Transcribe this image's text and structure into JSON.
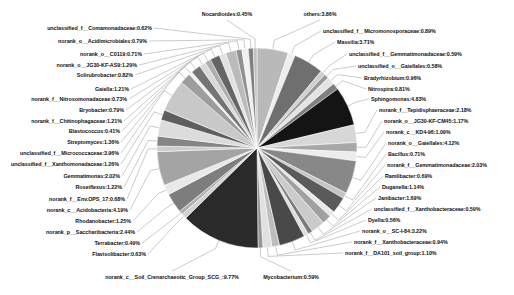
{
  "chart_data": {
    "type": "pie",
    "title": "",
    "subtitle": "",
    "xlabel": "",
    "ylabel": "",
    "legend_position": "labels-with-leader-lines",
    "grid": false,
    "value_unit": "percent",
    "label_format": "{name}:{value}%",
    "categories": [
      "others",
      "unclassified_f__Micromonosporaceae",
      "Massilia",
      "unclassified_f__Gemmatimonadaceae",
      "unclassified_o__Gaiellales",
      "Bradyrhizobium",
      "Nitrospira",
      "Sphingomonas",
      "norank_f__Tepidisphaeraceae",
      "norank_o__JG30-KF-CM45",
      "norank_c__KD4-96",
      "norank_o__Gaiellales",
      "Bacillus",
      "norank_f__Gemmatimonadaceae",
      "Ramlibacter",
      "Duganella",
      "Janibacter",
      "unclassified_f__Xanthobacteraceae",
      "Dyella",
      "norank_o__SC-I-84",
      "norank_f__Xanthobacteraceae",
      "norank_f__DA101_soil_group",
      "Mycobacterium",
      "norank_c__Soil_Crenarchaeotic_Group_SCG_",
      "Flavisolibacter",
      "Terrabacter",
      "norank_p__Saccharibacteria",
      "Rhodanobacter",
      "norank_c__Acidobacteria",
      "norank_f__Env.OPS_17",
      "Roseiflexus",
      "Gemmatimonas",
      "unclassified_f__Xanthomonadaceae",
      "unclassified_f__Micrococcaceae",
      "Streptomyces",
      "Blastococcus",
      "norank_f__Chitinophagaceae",
      "Bryobacter",
      "norank_f__Nitrosomonadaceae",
      "Gaiella",
      "Solirubrobacter",
      "norank_o__JG30-KF-AS9",
      "norank_o__C0119",
      "norank_o__Acidimicrobiales",
      "unclassified_f__Comamonadaceae",
      "Nocardioides"
    ],
    "values": [
      3.86,
      0.89,
      3.71,
      0.59,
      0.58,
      0.96,
      0.81,
      4.83,
      2.18,
      1.17,
      1.09,
      4.12,
      0.71,
      2.03,
      0.69,
      1.14,
      1.69,
      0.59,
      0.56,
      3.22,
      0.94,
      1.1,
      0.59,
      9.77,
      0.63,
      0.49,
      2.44,
      1.25,
      4.19,
      0.68,
      1.22,
      2.02,
      1.26,
      3.96,
      1.36,
      0.41,
      1.21,
      0.79,
      0.73,
      1.21,
      0.82,
      1.29,
      0.71,
      0.79,
      0.62,
      0.45
    ],
    "slice_colors": [
      "#b9b9b9",
      "#eeeeee",
      "#6f6f6f",
      "#cfcfcf",
      "#9a9a9a",
      "#e4e4e4",
      "#7f7f7f",
      "#141414",
      "#d7d7d7",
      "#a8a8a8",
      "#ececec",
      "#888888",
      "#c4c4c4",
      "#5a5a5a",
      "#e8e8e8",
      "#a0a0a0",
      "#cbcbcb",
      "#7a7a7a",
      "#dedede",
      "#494949",
      "#bdbdbd",
      "#e0e0e0",
      "#949494",
      "#2a2a2a",
      "#d2d2d2",
      "#b0b0b0",
      "#7d7d7d",
      "#e9e9e9",
      "#a4a4a4",
      "#cdcdcd",
      "#858585",
      "#dcdcdc",
      "#5e5e5e",
      "#c8c8c8",
      "#9d9d9d",
      "#efefef",
      "#747474",
      "#d9d9d9",
      "#aeaeae",
      "#656565",
      "#e2e2e2",
      "#bbbbbb",
      "#909090",
      "#f1f1f1",
      "#808080",
      "#c0c0c0"
    ],
    "labels": [
      {
        "name": "Nocardioides",
        "value": "0.45",
        "text": "Nocardioides:0.45%",
        "side": "top",
        "x": 227,
        "y": 14
      },
      {
        "name": "others",
        "value": "3.86",
        "text": "others:3.86%",
        "side": "top",
        "x": 320,
        "y": 14
      },
      {
        "name": "unclassified_f__Comamonadaceae",
        "value": "0.62",
        "text": "unclassified_f__Comamonadaceae:0.62%",
        "side": "left",
        "x": 152,
        "y": 28
      },
      {
        "name": "unclassified_f__Micromonosporaceae",
        "value": "0.89",
        "text": "unclassified_f__Micromonosporaceae:0.89%",
        "side": "right",
        "x": 323,
        "y": 31
      },
      {
        "name": "norank_o__Acidimicrobiales",
        "value": "0.79",
        "text": "norank_o__Acidimicrobiales:0.79%",
        "side": "left",
        "x": 147,
        "y": 41
      },
      {
        "name": "Massilia",
        "value": "3.71",
        "text": "Massilia:3.71%",
        "side": "right",
        "x": 337,
        "y": 42
      },
      {
        "name": "norank_o__C0119",
        "value": "0.71",
        "text": "norank_o__C0119:0.71%",
        "side": "left",
        "x": 142,
        "y": 54
      },
      {
        "name": "unclassified_f__Gemmatimonadaceae",
        "value": "0.59",
        "text": "unclassified_f__Gemmatimonadaceae:0.59%",
        "side": "right",
        "x": 349,
        "y": 54
      },
      {
        "name": "norank_o__JG30-KF-AS9",
        "value": "1.29",
        "text": "norank_o__JG30-KF-AS9:1.29%",
        "side": "left",
        "x": 137,
        "y": 65
      },
      {
        "name": "unclassified_o__Gaiellales",
        "value": "0.58",
        "text": "unclassified_o__Gaiellales:0.58%",
        "side": "right",
        "x": 358,
        "y": 66
      },
      {
        "name": "Solirubrobacter",
        "value": "0.82",
        "text": "Solirubrobacter:0.82%",
        "side": "left",
        "x": 133,
        "y": 75
      },
      {
        "name": "Bradyrhizobium",
        "value": "0.96",
        "text": "Bradyrhizobium:0.96%",
        "side": "right",
        "x": 364,
        "y": 78
      },
      {
        "name": "Gaiella",
        "value": "1.21",
        "text": "Gaiella:1.21%",
        "side": "left",
        "x": 129,
        "y": 89
      },
      {
        "name": "Nitrospira",
        "value": "0.81",
        "text": "Nitrospira:0.81%",
        "side": "right",
        "x": 368,
        "y": 89
      },
      {
        "name": "norank_f__Nitrosomonadaceae",
        "value": "0.73",
        "text": "norank_f__Nitrosomonadaceae:0.73%",
        "side": "left",
        "x": 127,
        "y": 99
      },
      {
        "name": "Sphingomonas",
        "value": "4.83",
        "text": "Sphingomonas:4.83%",
        "side": "right",
        "x": 371,
        "y": 99
      },
      {
        "name": "Bryobacter",
        "value": "0.79",
        "text": "Bryobacter:0.79%",
        "side": "left",
        "x": 124,
        "y": 110
      },
      {
        "name": "norank_f__Tepidisphaeraceae",
        "value": "2.18",
        "text": "norank_f__Tepidisphaeraceae:2.18%",
        "side": "right",
        "x": 379,
        "y": 110
      },
      {
        "name": "norank_f__Chitinophagaceae",
        "value": "1.21",
        "text": "norank_f__Chitinophagaceae:1.21%",
        "side": "left",
        "x": 122,
        "y": 121
      },
      {
        "name": "norank_o__JG30-KF-CM45",
        "value": "1.17",
        "text": "norank_o__JG30-KF-CM45:1.17%",
        "side": "right",
        "x": 384,
        "y": 121
      },
      {
        "name": "Blastococcus",
        "value": "0.41",
        "text": "Blastococcus:0.41%",
        "side": "left",
        "x": 120,
        "y": 131
      },
      {
        "name": "norank_c__KD4-96",
        "value": "1.09",
        "text": "norank_c__KD4-96:1.09%",
        "side": "right",
        "x": 386,
        "y": 132
      },
      {
        "name": "Streptomyces",
        "value": "1.36",
        "text": "Streptomyces:1.36%",
        "side": "left",
        "x": 119,
        "y": 142
      },
      {
        "name": "norank_o__Gaiellales",
        "value": "4.12",
        "text": "norank_o__Gaiellales:4.12%",
        "side": "right",
        "x": 388,
        "y": 143
      },
      {
        "name": "unclassified_f__Micrococcaceae",
        "value": "3.96",
        "text": "unclassified_f__Micrococcaceae:3.96%",
        "side": "left",
        "x": 119,
        "y": 153
      },
      {
        "name": "Bacillus",
        "value": "0.71",
        "text": "Bacillus:0.71%",
        "side": "right",
        "x": 388,
        "y": 154
      },
      {
        "name": "unclassified_f__Xanthomonadaceae",
        "value": "1.26",
        "text": "unclassified_f__Xanthomonadaceae:1.26%",
        "side": "left",
        "x": 119,
        "y": 164
      },
      {
        "name": "norank_f__Gemmatimonadaceae",
        "value": "2.03",
        "text": "norank_f__Gemmatimonadaceae:2.03%",
        "side": "right",
        "x": 387,
        "y": 165
      },
      {
        "name": "Gemmatimonas",
        "value": "2.02",
        "text": "Gemmatimonas:2.02%",
        "side": "left",
        "x": 120,
        "y": 176
      },
      {
        "name": "Ramlibacter",
        "value": "0.69",
        "text": "Ramlibacter:0.69%",
        "side": "right",
        "x": 385,
        "y": 176
      },
      {
        "name": "Roseiflexus",
        "value": "1.22",
        "text": "Roseiflexus:1.22%",
        "side": "left",
        "x": 122,
        "y": 187
      },
      {
        "name": "Duganella",
        "value": "1.14",
        "text": "Duganella:1.14%",
        "side": "right",
        "x": 382,
        "y": 187
      },
      {
        "name": "norank_f__Env.OPS_17",
        "value": "0.68",
        "text": "norank_f__Env.OPS_17:0.68%",
        "side": "left",
        "x": 125,
        "y": 199
      },
      {
        "name": "Janibacter",
        "value": "1.69",
        "text": "Janibacter:1.69%",
        "side": "right",
        "x": 378,
        "y": 198
      },
      {
        "name": "norank_c__Acidobacteria",
        "value": "4.19",
        "text": "norank_c__Acidobacteria:4.19%",
        "side": "left",
        "x": 128,
        "y": 210
      },
      {
        "name": "unclassified_f__Xanthobacteraceae",
        "value": "0.59",
        "text": "unclassified_f__Xanthobacteraceae:0.59%",
        "side": "right",
        "x": 374,
        "y": 209
      },
      {
        "name": "Rhodanobacter",
        "value": "1.25",
        "text": "Rhodanobacter:1.25%",
        "side": "left",
        "x": 131,
        "y": 221
      },
      {
        "name": "Dyella",
        "value": "0.56",
        "text": "Dyella:0.56%",
        "side": "right",
        "x": 368,
        "y": 220
      },
      {
        "name": "norank_p__Saccharibacteria",
        "value": "2.44",
        "text": "norank_p__Saccharibacteria:2.44%",
        "side": "left",
        "x": 135,
        "y": 232
      },
      {
        "name": "norank_o__SC-I-84",
        "value": "3.22",
        "text": "norank_o__SC-I-84:3.22%",
        "side": "right",
        "x": 362,
        "y": 231
      },
      {
        "name": "Terrabacter",
        "value": "0.49",
        "text": "Terrabacter:0.49%",
        "side": "left",
        "x": 140,
        "y": 243
      },
      {
        "name": "norank_f__Xanthobacteraceae",
        "value": "0.94",
        "text": "norank_f__Xanthobacteraceae:0.94%",
        "side": "right",
        "x": 354,
        "y": 242
      },
      {
        "name": "Flavisolibacter",
        "value": "0.63",
        "text": "Flavisolibacter:0.63%",
        "side": "left",
        "x": 146,
        "y": 254
      },
      {
        "name": "norank_f__DA101_soil_group",
        "value": "1.10",
        "text": "norank_f__DA101_soil_group:1.10%",
        "side": "right",
        "x": 345,
        "y": 253
      },
      {
        "name": "norank_c__Soil_Crenarchaeotic_Group_SCG_",
        "value": "9.77",
        "text": "norank_c__Soil_Crenarchaeotic_Group_SCG_:9.77%",
        "side": "bottom",
        "x": 172,
        "y": 277
      },
      {
        "name": "Mycobacterium",
        "value": "0.59",
        "text": "Mycobacterium:0.59%",
        "side": "bottom",
        "x": 291,
        "y": 277
      }
    ]
  },
  "figure": {
    "background_color": "#ffffff",
    "text_color": "#111111",
    "leader_line_color": "#8a8a8a",
    "pie_center_x": 257,
    "pie_center_y": 148,
    "pie_radius": 100
  }
}
